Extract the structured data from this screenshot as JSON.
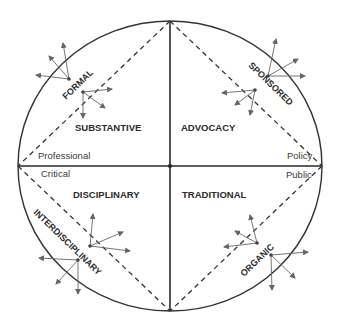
{
  "diagram": {
    "type": "quadrant-circle-diagram",
    "colors": {
      "line": "#333333",
      "arrow": "#666666",
      "text": "#2b2b2b"
    },
    "quadrants": {
      "top_left": "SUBSTANTIVE",
      "top_right": "ADVOCACY",
      "bottom_left": "DISCIPLINARY",
      "bottom_right": "TRADITIONAL"
    },
    "diagonal_labels": {
      "top_left": "FORMAL",
      "top_right": "SPONSORED",
      "bottom_left": "INTERDISCIPLINARY",
      "bottom_right": "ORGANIC"
    },
    "axis_labels": {
      "left_above": "Professional",
      "left_below": "Critical",
      "right_above": "Policy",
      "right_below": "Public"
    },
    "arrow_clusters": [
      {
        "region": "FORMAL",
        "origin": [
          69,
          79
        ],
        "targets": [
          [
            63,
            43
          ],
          [
            49,
            56
          ],
          [
            36,
            75
          ]
        ]
      },
      {
        "region": "FORMAL",
        "origin": [
          83,
          92
        ],
        "targets": [
          [
            112,
            89
          ],
          [
            105,
            108
          ],
          [
            83,
            118
          ]
        ]
      },
      {
        "region": "SPONSORED",
        "origin": [
          268,
          76
        ],
        "targets": [
          [
            276,
            39
          ],
          [
            298,
            59
          ],
          [
            305,
            76
          ]
        ]
      },
      {
        "region": "SPONSORED",
        "origin": [
          255,
          90
        ],
        "targets": [
          [
            222,
            93
          ],
          [
            235,
            105
          ],
          [
            250,
            115
          ]
        ]
      },
      {
        "region": "INTERDISCIPLINARY",
        "origin": [
          90,
          246
        ],
        "targets": [
          [
            93,
            214
          ],
          [
            123,
            232
          ],
          [
            130,
            251
          ]
        ]
      },
      {
        "region": "INTERDISCIPLINARY",
        "origin": [
          78,
          260
        ],
        "targets": [
          [
            39,
            258
          ],
          [
            56,
            284
          ],
          [
            78,
            294
          ]
        ]
      },
      {
        "region": "ORGANIC",
        "origin": [
          257,
          243
        ],
        "targets": [
          [
            250,
            215
          ],
          [
            235,
            231
          ],
          [
            224,
            247
          ]
        ]
      },
      {
        "region": "ORGANIC",
        "origin": [
          271,
          255
        ],
        "targets": [
          [
            308,
            252
          ],
          [
            295,
            278
          ],
          [
            272,
            290
          ]
        ]
      }
    ]
  }
}
